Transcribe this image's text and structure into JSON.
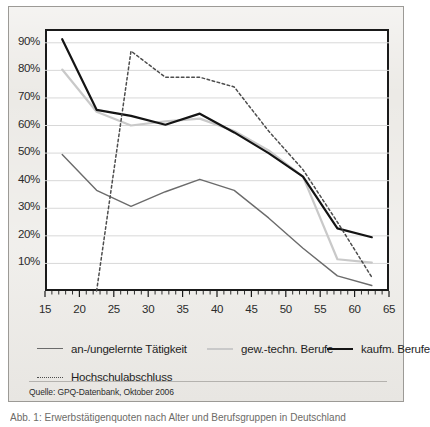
{
  "source": {
    "label": "Quelle: GPQ-Datenbank, Oktober 2006"
  },
  "caption": {
    "text": "Abb. 1: Erwerbstätigenquoten nach Alter und Berufsgruppen in Deutschland"
  },
  "colors": {
    "ungelernte": "#6b6b6b",
    "gew_techn": "#c9c9c9",
    "kaufm": "#141414",
    "hochschul": "#4d4d4d",
    "plot_border": "#1a1a1a",
    "grid": "#d8d8d8",
    "panel_bg": "#eceae6",
    "plot_bg": "#ffffff"
  },
  "chart_data": {
    "type": "line",
    "title": "",
    "subtitle": "",
    "xlabel": "",
    "ylabel": "",
    "xlim": [
      15,
      65
    ],
    "ylim": [
      0,
      95
    ],
    "grid": true,
    "legend_position": "bottom",
    "yticks": [
      10,
      20,
      30,
      40,
      50,
      60,
      70,
      80,
      90
    ],
    "ytick_labels": [
      "10%",
      "20%",
      "30%",
      "40%",
      "50%",
      "60%",
      "70%",
      "80%",
      "90%"
    ],
    "xticks": [
      15,
      20,
      25,
      30,
      35,
      40,
      45,
      50,
      55,
      60,
      65
    ],
    "xtick_labels": [
      "15",
      "20",
      "25",
      "30",
      "35",
      "40",
      "45",
      "50",
      "55",
      "60",
      "65"
    ],
    "x_minor_tick_step": 1,
    "series": [
      {
        "name": "an-/ungelernte Tätigkeit",
        "style": "solid",
        "color": "#6b6b6b",
        "width": 1.4,
        "x": [
          17.5,
          22.5,
          27.5,
          32.5,
          37.5,
          42.5,
          47.5,
          52.5,
          57.5,
          62.5
        ],
        "y": [
          49.5,
          36.5,
          30.7,
          36.0,
          40.5,
          36.5,
          26.5,
          15.5,
          5.5,
          2.0
        ]
      },
      {
        "name": "gew.-techn. Berufe",
        "style": "solid",
        "color": "#c9c9c9",
        "width": 2.2,
        "x": [
          17.5,
          22.5,
          27.5,
          32.5,
          37.5,
          42.5,
          47.5,
          52.5,
          57.5,
          62.5
        ],
        "y": [
          80.3,
          65.0,
          60.0,
          61.5,
          62.5,
          58.0,
          51.0,
          41.5,
          11.5,
          10.3
        ]
      },
      {
        "name": "kaufm. Berufe",
        "style": "solid",
        "color": "#141414",
        "width": 2.2,
        "x": [
          17.5,
          22.5,
          27.5,
          32.5,
          37.5,
          42.5,
          47.5,
          52.5,
          57.5,
          62.5
        ],
        "y": [
          91.3,
          65.7,
          63.5,
          60.3,
          64.3,
          57.5,
          50.0,
          41.5,
          22.7,
          19.5
        ]
      },
      {
        "name": "Hochschulabschluss",
        "style": "dotted",
        "color": "#4d4d4d",
        "width": 1.5,
        "x": [
          22.5,
          27.5,
          32.5,
          37.5,
          42.5,
          47.5,
          52.5,
          57.5,
          62.5
        ],
        "y": [
          0.0,
          87.0,
          77.5,
          77.5,
          74.0,
          58.0,
          44.0,
          25.0,
          5.0
        ]
      }
    ]
  },
  "legend": {
    "rows": [
      [
        {
          "label": "an-/ungelernte Tätigkeit",
          "style": "solid",
          "color": "#6b6b6b",
          "width": 1.6
        },
        {
          "label": "gew.-techn. Berufe",
          "style": "solid",
          "color": "#c9c9c9",
          "width": 2.2
        },
        {
          "label": "kaufm. Berufe",
          "style": "solid",
          "color": "#141414",
          "width": 2.2
        }
      ],
      [
        {
          "label": "Hochschulabschluss",
          "style": "dotted",
          "color": "#4d4d4d",
          "width": 1.6
        }
      ]
    ]
  }
}
